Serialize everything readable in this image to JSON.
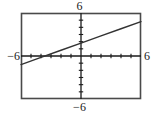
{
  "figure": {
    "name": "calculator-viewing-window",
    "frame": {
      "left": 21,
      "top": 13,
      "right": 141,
      "bottom": 99
    },
    "colors": {
      "frame": "#4a4a4a",
      "axis": "#1a1a1a",
      "curve": "#333333",
      "label": "#1a1a1a",
      "background": "#ffffff"
    }
  },
  "labels": {
    "top": "6",
    "bottom": "−6",
    "left": "−6",
    "right": "6"
  },
  "chart_data": {
    "type": "line",
    "title": "",
    "xlabel": "",
    "ylabel": "",
    "xlim": [
      -6,
      6
    ],
    "ylim": [
      -6,
      6
    ],
    "xticks": [
      -5,
      -4,
      -3,
      -2,
      -1,
      1,
      2,
      3,
      4,
      5
    ],
    "yticks": [
      -5,
      -4,
      -3,
      -2,
      -1,
      1,
      2,
      3,
      4,
      5
    ],
    "tick_label_top": "6",
    "tick_label_bottom": "-6",
    "tick_label_left": "-6",
    "tick_label_right": "6",
    "grid": false,
    "legend": "none",
    "axes_cross": [
      0,
      0
    ],
    "series": [
      {
        "name": "line",
        "slope": 0.5,
        "intercept": 1.8,
        "x": [
          -6,
          -4,
          -2,
          0,
          2,
          4,
          6
        ],
        "values": [
          -1.2,
          -0.2,
          0.8,
          1.8,
          2.8,
          3.8,
          4.8
        ],
        "color": "#333333",
        "style": "solid"
      }
    ]
  }
}
